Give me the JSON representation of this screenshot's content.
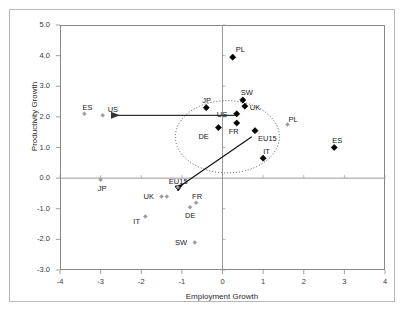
{
  "chart_data": {
    "type": "scatter",
    "title": "",
    "xlabel": "Employment Growth",
    "ylabel": "Productivity Growth",
    "xlim": [
      -4,
      4
    ],
    "ylim": [
      -3.0,
      5.0
    ],
    "xticks": [
      "-4",
      "-3",
      "-2",
      "-1",
      "0",
      "1",
      "2",
      "3",
      "4"
    ],
    "xtick_values": [
      -4,
      -3,
      -2,
      -1,
      0,
      1,
      2,
      3,
      4
    ],
    "yticks": [
      "5.0",
      "4.0",
      "3.0",
      "2.0",
      "1.0",
      "0.0",
      "-1.0",
      "-2.0",
      "-3.0"
    ],
    "ytick_values": [
      5.0,
      4.0,
      3.0,
      2.0,
      1.0,
      0.0,
      -1.0,
      -2.0,
      -3.0
    ],
    "grid": false,
    "legend": "none",
    "zero_lines": {
      "x": 0,
      "y": 0
    },
    "series": [
      {
        "name": "Earlier period",
        "marker": "small-diamond",
        "color": "#9a9a9a",
        "points": [
          {
            "label": "ES",
            "x": -3.4,
            "y": 2.1,
            "label_dx": -2,
            "label_dy": -11
          },
          {
            "label": "US",
            "x": -2.95,
            "y": 2.05,
            "label_dx": 5,
            "label_dy": -10
          },
          {
            "label": "PL",
            "x": 1.6,
            "y": 1.75,
            "label_dx": 1,
            "label_dy": -10
          },
          {
            "label": "JP",
            "x": -3.0,
            "y": -0.05,
            "label_dx": -3,
            "label_dy": 4
          },
          {
            "label": "UK",
            "x": -1.5,
            "y": -0.6,
            "label_dx": -18,
            "label_dy": -5
          },
          {
            "label": "UK2",
            "x": -1.37,
            "y": -0.6,
            "label_dx": 0,
            "label_dy": 0,
            "hide_label": true
          },
          {
            "label": "EU15",
            "x": -1.1,
            "y": -0.3,
            "label_dx": -9,
            "label_dy": -10
          },
          {
            "label": "FR",
            "x": -0.65,
            "y": -0.8,
            "label_dx": -4,
            "label_dy": -11
          },
          {
            "label": "DE",
            "x": -0.8,
            "y": -0.95,
            "label_dx": -5,
            "label_dy": 4
          },
          {
            "label": "IT",
            "x": -1.9,
            "y": -1.25,
            "label_dx": -12,
            "label_dy": 1
          },
          {
            "label": "SW",
            "x": -0.68,
            "y": -2.1,
            "label_dx": -20,
            "label_dy": -4
          }
        ]
      },
      {
        "name": "Later period",
        "marker": "diamond",
        "color": "#000000",
        "points": [
          {
            "label": "PL",
            "x": 0.25,
            "y": 3.95,
            "label_dx": 3,
            "label_dy": -12
          },
          {
            "label": "SW",
            "x": 0.5,
            "y": 2.55,
            "label_dx": -2,
            "label_dy": -12
          },
          {
            "label": "UK",
            "x": 0.55,
            "y": 2.35,
            "label_dx": 5,
            "label_dy": -3
          },
          {
            "label": "JP",
            "x": -0.4,
            "y": 2.3,
            "label_dx": -4,
            "label_dy": -12
          },
          {
            "label": "US",
            "x": 0.35,
            "y": 2.1,
            "label_dx": -20,
            "label_dy": -4
          },
          {
            "label": "FR",
            "x": 0.35,
            "y": 1.8,
            "label_dx": -8,
            "label_dy": 4
          },
          {
            "label": "DE",
            "x": -0.1,
            "y": 1.65,
            "label_dx": -20,
            "label_dy": 4
          },
          {
            "label": "EU15",
            "x": 0.8,
            "y": 1.55,
            "label_dx": 3,
            "label_dy": 3
          },
          {
            "label": "IT",
            "x": 1.0,
            "y": 0.65,
            "label_dx": 0,
            "label_dy": -11
          },
          {
            "label": "ES",
            "x": 2.75,
            "y": 1.0,
            "label_dx": -2,
            "label_dy": -12
          }
        ]
      }
    ],
    "annotations": [
      {
        "name": "us-shift-arrow",
        "type": "arrow",
        "from": {
          "x": 0.35,
          "y": 2.05
        },
        "to": {
          "x": -2.72,
          "y": 2.05
        },
        "color": "#333333"
      },
      {
        "name": "eu15-shift-arrow",
        "type": "arrow",
        "from": {
          "x": 0.72,
          "y": 1.35
        },
        "to": {
          "x": -1.12,
          "y": -0.33
        },
        "color": "#111111"
      },
      {
        "name": "cluster-ellipse",
        "type": "ellipse",
        "cx": 0.12,
        "cy": 1.35,
        "rx": 1.28,
        "ry": 1.18,
        "style": "dotted",
        "color": "#555555"
      }
    ]
  }
}
